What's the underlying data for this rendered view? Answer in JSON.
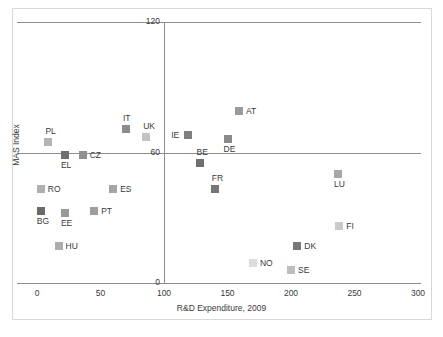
{
  "chart_data": {
    "type": "scatter",
    "title": "",
    "xlabel": "R&D Expenditure, 2009",
    "ylabel": "MAS Index",
    "xlim": [
      0,
      300
    ],
    "ylim": [
      0,
      120
    ],
    "xticks": [
      "0",
      "50",
      "100",
      "150",
      "200",
      "250",
      "300"
    ],
    "yticks": [
      "0",
      "60",
      "120"
    ],
    "grid": "horizontal gridlines at 0, 60, 120; vertical axis line at x=100",
    "legend": "none",
    "points": [
      {
        "label": "PL",
        "x": 9,
        "y": 65,
        "color": "#b5b5b5",
        "label_pos": "above"
      },
      {
        "label": "IT",
        "x": 70,
        "y": 71,
        "color": "#8c8c8c",
        "label_pos": "above"
      },
      {
        "label": "UK",
        "x": 86,
        "y": 67,
        "color": "#c3c3c3",
        "label_pos": "above"
      },
      {
        "label": "EL",
        "x": 22,
        "y": 59,
        "color": "#6e6e6e",
        "label_pos": "below"
      },
      {
        "label": "CZ",
        "x": 36,
        "y": 59,
        "color": "#919191",
        "label_pos": "right"
      },
      {
        "label": "AT",
        "x": 159,
        "y": 79,
        "color": "#9a9a9a",
        "label_pos": "right"
      },
      {
        "label": "IE",
        "x": 119,
        "y": 68,
        "color": "#808080",
        "label_pos": "left"
      },
      {
        "label": "DE",
        "x": 150,
        "y": 66,
        "color": "#8a8a8a",
        "label_pos": "below"
      },
      {
        "label": "BE",
        "x": 128,
        "y": 55,
        "color": "#707070",
        "label_pos": "above"
      },
      {
        "label": "FR",
        "x": 140,
        "y": 43,
        "color": "#767676",
        "label_pos": "above"
      },
      {
        "label": "LU",
        "x": 237,
        "y": 50,
        "color": "#a8a8a8",
        "label_pos": "below"
      },
      {
        "label": "RO",
        "x": 3,
        "y": 43,
        "color": "#b0b0b0",
        "label_pos": "right"
      },
      {
        "label": "ES",
        "x": 60,
        "y": 43,
        "color": "#a4a4a4",
        "label_pos": "right"
      },
      {
        "label": "BG",
        "x": 3,
        "y": 33,
        "color": "#6a6a6a",
        "label_pos": "below"
      },
      {
        "label": "EE",
        "x": 22,
        "y": 32,
        "color": "#999999",
        "label_pos": "below"
      },
      {
        "label": "PT",
        "x": 45,
        "y": 33,
        "color": "#9e9e9e",
        "label_pos": "right"
      },
      {
        "label": "FI",
        "x": 238,
        "y": 26,
        "color": "#c9c9c9",
        "label_pos": "right"
      },
      {
        "label": "HU",
        "x": 17,
        "y": 17,
        "color": "#adadad",
        "label_pos": "right"
      },
      {
        "label": "DK",
        "x": 205,
        "y": 17,
        "color": "#787878",
        "label_pos": "right"
      },
      {
        "label": "NO",
        "x": 170,
        "y": 9,
        "color": "#dcdcdc",
        "label_pos": "right"
      },
      {
        "label": "SE",
        "x": 200,
        "y": 6,
        "color": "#bdbdbd",
        "label_pos": "right"
      }
    ]
  },
  "axes": {
    "y_label_text": "MAS Index",
    "x_label_text": "R&D Expenditure, 2009"
  },
  "colors": {
    "axis_line": "#8e8e8e",
    "text": "#3a3a3a",
    "border": "#d8d8d8",
    "background": "#ffffff"
  }
}
